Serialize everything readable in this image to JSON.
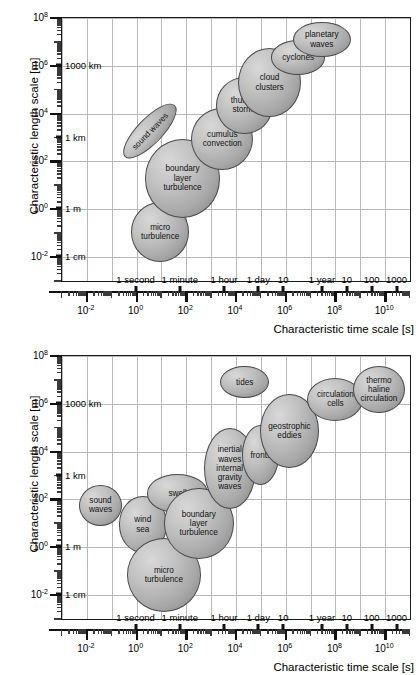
{
  "figure": {
    "panels": [
      {
        "id": "atmosphere",
        "axes": {
          "xlabel": "Characteristic time scale [s]",
          "ylabel": "Characteristic length scale [m]",
          "xlim": [
            -3,
            11
          ],
          "ylim": [
            -3,
            8
          ],
          "xtick_exponents": [
            -2,
            0,
            2,
            4,
            6,
            8,
            10
          ],
          "ytick_exponents": [
            -2,
            0,
            2,
            4,
            6,
            8
          ],
          "x_named_ticks": [
            {
              "label": "1 second",
              "log_t": 0
            },
            {
              "label": "1 minute",
              "log_t": 1.778
            },
            {
              "label": "1 hour",
              "log_t": 3.556
            },
            {
              "label": "1 day",
              "log_t": 4.937
            },
            {
              "label": "10",
              "log_t": 5.937
            },
            {
              "label": "1 year",
              "log_t": 7.499
            },
            {
              "label": "10",
              "log_t": 8.499
            },
            {
              "label": "100",
              "log_t": 9.499
            },
            {
              "label": "1000",
              "log_t": 10.499
            }
          ],
          "y_named_ticks": [
            {
              "label": "1000 km",
              "log_l": 6
            },
            {
              "label": "1 km",
              "log_l": 3
            },
            {
              "label": "1 m",
              "log_l": 0
            },
            {
              "label": "1 cm",
              "log_l": -2
            }
          ],
          "grid": true
        },
        "bubbles": [
          {
            "name": "micro turbulence",
            "label": "micro\nturbulence",
            "log_t": 0.95,
            "log_l": -0.95,
            "w_dec": 2.35,
            "h_dec": 2.5,
            "rot": 0
          },
          {
            "name": "sound waves",
            "label": "sound waves",
            "log_t": 0.55,
            "log_l": 3.25,
            "w_dec": 2.9,
            "h_dec": 1.1,
            "rot": -46
          },
          {
            "name": "boundary layer turbulence",
            "label": "boundary\nlayer\nturbulence",
            "log_t": 1.85,
            "log_l": 1.3,
            "w_dec": 3.05,
            "h_dec": 3.3,
            "rot": 0
          },
          {
            "name": "cumulus convection",
            "label": "cumulus\nconvection",
            "log_t": 3.45,
            "log_l": 2.95,
            "w_dec": 2.5,
            "h_dec": 2.6,
            "rot": 0
          },
          {
            "name": "thunder storms",
            "label": "thunder\nstorms",
            "log_t": 4.35,
            "log_l": 4.35,
            "w_dec": 2.3,
            "h_dec": 2.4,
            "rot": 0
          },
          {
            "name": "cloud clusters",
            "label": "cloud\nclusters",
            "log_t": 5.35,
            "log_l": 5.3,
            "w_dec": 2.55,
            "h_dec": 2.9,
            "rot": 0
          },
          {
            "name": "cyclones",
            "label": "cyclones",
            "log_t": 6.5,
            "log_l": 6.35,
            "w_dec": 2.2,
            "h_dec": 1.45,
            "rot": 0
          },
          {
            "name": "planetary waves",
            "label": "planetary\nwaves",
            "log_t": 7.45,
            "log_l": 7.1,
            "w_dec": 2.35,
            "h_dec": 1.5,
            "rot": 0
          }
        ]
      },
      {
        "id": "ocean",
        "axes": {
          "xlabel": "Characteristic time scale [s]",
          "ylabel": "Characteristic length scale [m]",
          "xlim": [
            -3,
            11
          ],
          "ylim": [
            -3,
            8
          ],
          "xtick_exponents": [
            -2,
            0,
            2,
            4,
            6,
            8,
            10
          ],
          "ytick_exponents": [
            -2,
            0,
            2,
            4,
            6,
            8
          ],
          "x_named_ticks": [
            {
              "label": "1 second",
              "log_t": 0
            },
            {
              "label": "1 minute",
              "log_t": 1.778
            },
            {
              "label": "1 hour",
              "log_t": 3.556
            },
            {
              "label": "1 day",
              "log_t": 4.937
            },
            {
              "label": "10",
              "log_t": 5.937
            },
            {
              "label": "1 year",
              "log_t": 7.499
            },
            {
              "label": "10",
              "log_t": 8.499
            },
            {
              "label": "100",
              "log_t": 9.499
            },
            {
              "label": "1000",
              "log_t": 10.499
            }
          ],
          "y_named_ticks": [
            {
              "label": "1000 km",
              "log_l": 6
            },
            {
              "label": "1 km",
              "log_l": 3
            },
            {
              "label": "1 m",
              "log_l": 0
            },
            {
              "label": "1 cm",
              "log_l": -2
            }
          ],
          "grid": true
        },
        "bubbles": [
          {
            "name": "sound waves",
            "label": "sound\nwaves",
            "log_t": -1.45,
            "log_l": 1.75,
            "w_dec": 1.75,
            "h_dec": 1.75,
            "rot": 0
          },
          {
            "name": "wind sea",
            "label": "wind\nsea",
            "log_t": 0.25,
            "log_l": 0.95,
            "w_dec": 1.95,
            "h_dec": 2.35,
            "rot": 0
          },
          {
            "name": "micro turbulence",
            "label": "micro\nturbulence",
            "log_t": 1.1,
            "log_l": -1.15,
            "w_dec": 3.0,
            "h_dec": 3.1,
            "rot": 0
          },
          {
            "name": "swell",
            "label": "swell",
            "log_t": 1.65,
            "log_l": 2.25,
            "w_dec": 2.45,
            "h_dec": 1.6,
            "rot": 0
          },
          {
            "name": "boundary layer turbulence",
            "label": "boundary\nlayer\nturbulence",
            "log_t": 2.5,
            "log_l": 1.0,
            "w_dec": 2.8,
            "h_dec": 3.0,
            "rot": 0
          },
          {
            "name": "inertial waves internal gravity waves",
            "label": "inertial\nwaves\ninternal\ngravity\nwaves",
            "log_t": 3.75,
            "log_l": 3.3,
            "w_dec": 2.1,
            "h_dec": 3.4,
            "rot": 0
          },
          {
            "name": "tides",
            "label": "tides",
            "log_t": 4.35,
            "log_l": 6.9,
            "w_dec": 1.95,
            "h_dec": 1.35,
            "rot": 0
          },
          {
            "name": "fronts",
            "label": "fronts",
            "log_t": 5.0,
            "log_l": 3.85,
            "w_dec": 1.5,
            "h_dec": 2.5,
            "rot": 0
          },
          {
            "name": "geostrophic eddies",
            "label": "geostrophic\neddies",
            "log_t": 6.15,
            "log_l": 4.85,
            "w_dec": 2.35,
            "h_dec": 3.1,
            "rot": 0
          },
          {
            "name": "circulation cells",
            "label": "circulation\ncells",
            "log_t": 8.0,
            "log_l": 6.2,
            "w_dec": 2.25,
            "h_dec": 1.8,
            "rot": 0
          },
          {
            "name": "thermo haline circulation",
            "label": "thermo\nhaline\ncirculation",
            "log_t": 9.75,
            "log_l": 6.6,
            "w_dec": 2.1,
            "h_dec": 2.0,
            "rot": 0
          }
        ]
      }
    ]
  }
}
